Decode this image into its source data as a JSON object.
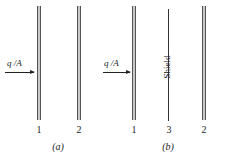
{
  "figure_a": {
    "flux_label": "q /A",
    "plates": [
      {
        "label": "1"
      },
      {
        "label": "2"
      }
    ],
    "caption": "(a)"
  },
  "figure_b": {
    "flux_label": "q /A",
    "plates": [
      {
        "label": "1"
      },
      {
        "label": "3"
      },
      {
        "label": "2"
      }
    ],
    "shield_label": "Shield",
    "caption": "(b)"
  }
}
